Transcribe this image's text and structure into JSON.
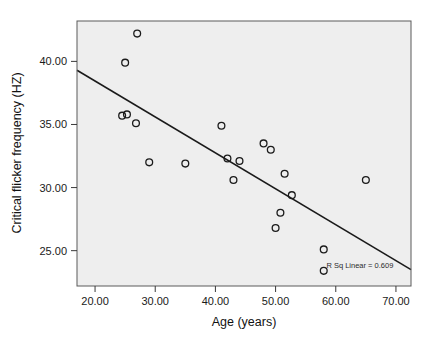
{
  "chart_data": {
    "type": "scatter",
    "title": "",
    "xlabel": "Age (years)",
    "ylabel": "Critical flicker frequency (HZ)",
    "xlim": [
      17.0,
      72.5
    ],
    "ylim": [
      22.2,
      43.2
    ],
    "xticks": [
      "20.00",
      "30.00",
      "40.00",
      "50.00",
      "60.00",
      "70.00"
    ],
    "xtick_values": [
      20,
      30,
      40,
      50,
      60,
      70
    ],
    "yticks": [
      "25.00",
      "30.00",
      "35.00",
      "40.00"
    ],
    "ytick_values": [
      25,
      30,
      35,
      40
    ],
    "grid": false,
    "legend": "none",
    "marker_shape": "open-circle",
    "points": [
      {
        "x": 27.0,
        "y": 42.2
      },
      {
        "x": 25.0,
        "y": 39.9
      },
      {
        "x": 24.5,
        "y": 35.7
      },
      {
        "x": 25.3,
        "y": 35.8
      },
      {
        "x": 26.8,
        "y": 35.1
      },
      {
        "x": 29.0,
        "y": 32.0
      },
      {
        "x": 35.0,
        "y": 31.9
      },
      {
        "x": 41.0,
        "y": 34.9
      },
      {
        "x": 42.0,
        "y": 32.3
      },
      {
        "x": 43.0,
        "y": 30.6
      },
      {
        "x": 44.0,
        "y": 32.1
      },
      {
        "x": 48.0,
        "y": 33.5
      },
      {
        "x": 49.2,
        "y": 33.0
      },
      {
        "x": 50.0,
        "y": 26.8
      },
      {
        "x": 50.8,
        "y": 28.0
      },
      {
        "x": 51.5,
        "y": 31.1
      },
      {
        "x": 52.7,
        "y": 29.4
      },
      {
        "x": 58.0,
        "y": 25.1
      },
      {
        "x": 58.0,
        "y": 23.4
      },
      {
        "x": 65.0,
        "y": 30.6
      }
    ],
    "fit_line": {
      "type": "linear",
      "x_start": 17.0,
      "y_start": 39.3,
      "x_end": 72.5,
      "y_end": 23.5
    },
    "annotation": {
      "text": "R Sq Linear = 0.609",
      "x": 64.0,
      "y": 23.6
    }
  }
}
